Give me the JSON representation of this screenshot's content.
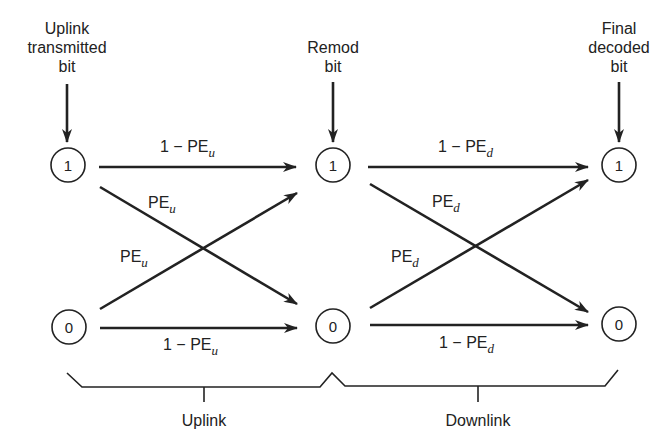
{
  "diagram": {
    "type": "binary-symmetric-channel-cascade",
    "headers": {
      "uplink_transmitted": [
        "Uplink",
        "transmitted",
        "bit"
      ],
      "remod": [
        "Remod",
        "bit"
      ],
      "final_decoded": [
        "Final",
        "decoded",
        "bit"
      ]
    },
    "nodes": {
      "left_top": "1",
      "left_bottom": "0",
      "mid_top": "1",
      "mid_bottom": "0",
      "right_top": "1",
      "right_bottom": "0"
    },
    "uplink": {
      "top_label_prefix": "1 − PE",
      "top_label_sub": "u",
      "cross_upper_prefix": "PE",
      "cross_upper_sub": "u",
      "cross_lower_prefix": "PE",
      "cross_lower_sub": "u",
      "bottom_label_prefix": "1 − PE",
      "bottom_label_sub": "u"
    },
    "downlink": {
      "top_label_prefix": "1 − PE",
      "top_label_sub": "d",
      "cross_upper_prefix": "PE",
      "cross_upper_sub": "d",
      "cross_lower_prefix": "PE",
      "cross_lower_sub": "d",
      "bottom_label_prefix": "1 − PE",
      "bottom_label_sub": "d"
    },
    "braces": {
      "uplink_label": "Uplink",
      "downlink_label": "Downlink"
    },
    "colors": {
      "ink": "#222222",
      "background": "#ffffff"
    }
  }
}
